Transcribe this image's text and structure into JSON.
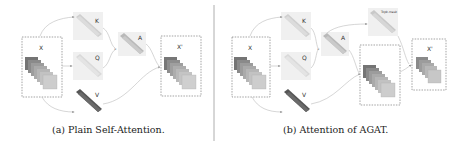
{
  "panels": [
    {
      "id": "a",
      "caption": "(a) Plain Self-Attention.",
      "labels": {
        "x": "X",
        "k": "K",
        "q": "Q",
        "v": "V",
        "a": "A",
        "out": "X'"
      },
      "op_symbol": "×"
    },
    {
      "id": "b",
      "caption": "(b) Attention of AGAT.",
      "labels": {
        "x": "X",
        "k": "K",
        "q": "Q",
        "v": "V",
        "a": "A",
        "mask": "Topk-mask",
        "out": "X'"
      },
      "op_symbol": "×"
    }
  ],
  "colors": {
    "input_dark": "#7a7a7a",
    "input_light": "#c8c8c8",
    "k_q": "#d8d8d8",
    "v_dark": "#606060",
    "a_block": "#bdbdbd",
    "divider": "#999999"
  }
}
